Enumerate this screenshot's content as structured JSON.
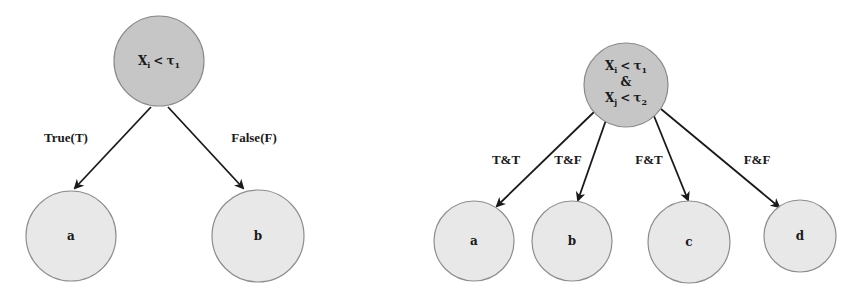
{
  "diagrams": [
    {
      "name": "binary-split",
      "root": {
        "var": "X",
        "var_sub": "i",
        "op": "<",
        "thr": "τ",
        "thr_sub": "1"
      },
      "edges": [
        {
          "label": "True(T)",
          "target": "a"
        },
        {
          "label": "False(F)",
          "target": "b"
        }
      ],
      "leaves": [
        "a",
        "b"
      ]
    },
    {
      "name": "four-way-split",
      "root": {
        "line1": {
          "var": "X",
          "var_sub": "i",
          "op": "<",
          "thr": "τ",
          "thr_sub": "1"
        },
        "joiner": "&",
        "line2": {
          "var": "X",
          "var_sub": "j",
          "op": "<",
          "thr": "τ",
          "thr_sub": "2"
        }
      },
      "edges": [
        {
          "label": "T&T",
          "target": "a"
        },
        {
          "label": "T&F",
          "target": "b"
        },
        {
          "label": "F&T",
          "target": "c"
        },
        {
          "label": "F&F",
          "target": "d"
        }
      ],
      "leaves": [
        "a",
        "b",
        "c",
        "d"
      ]
    }
  ],
  "colors": {
    "root_fill": "#c6c6c6",
    "leaf_fill": "#e8e8e8",
    "edge": "#1a1a1a"
  }
}
